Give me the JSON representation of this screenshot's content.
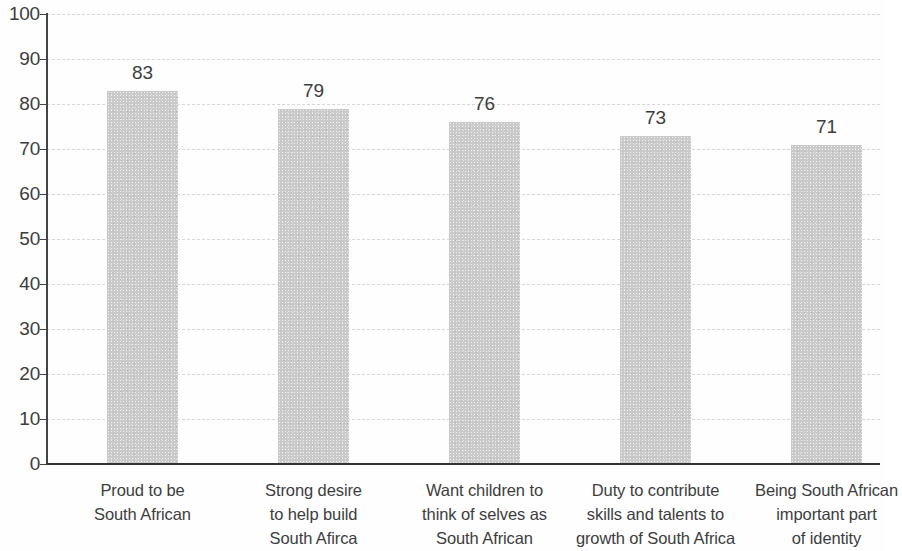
{
  "chart_data": {
    "type": "bar",
    "title": "",
    "subtitle": "",
    "xlabel": "",
    "ylabel": "",
    "ylim": [
      0,
      100
    ],
    "yticks": [
      0,
      10,
      20,
      30,
      40,
      50,
      60,
      70,
      80,
      90,
      100
    ],
    "ytick_labels": [
      "0",
      "10",
      "20",
      "30",
      "40",
      "50",
      "60",
      "70",
      "80",
      "90",
      "100"
    ],
    "grid": "horizontal-dashed",
    "legend": "none",
    "bar_color": "#c9c9c9",
    "axis_color": "#333333",
    "gridline_color": "#d8d8d8",
    "categories": [
      "Proud to be South African",
      "Strong desire to help build South Afirca",
      "Want children to think of selves as South African",
      "Duty to contribute skills and talents to growth of South Africa",
      "Being South African important part of identity"
    ],
    "category_lines": [
      [
        "Proud to be",
        "South African"
      ],
      [
        "Strong desire",
        "to help build",
        "South Afirca"
      ],
      [
        "Want children to",
        "think of selves as",
        "South African"
      ],
      [
        "Duty to contribute",
        "skills and talents to",
        "growth of South Africa"
      ],
      [
        "Being South African",
        "important part",
        "of identity"
      ]
    ],
    "values": [
      83,
      79,
      76,
      73,
      71
    ],
    "value_labels": [
      "83",
      "79",
      "76",
      "73",
      "71"
    ]
  }
}
